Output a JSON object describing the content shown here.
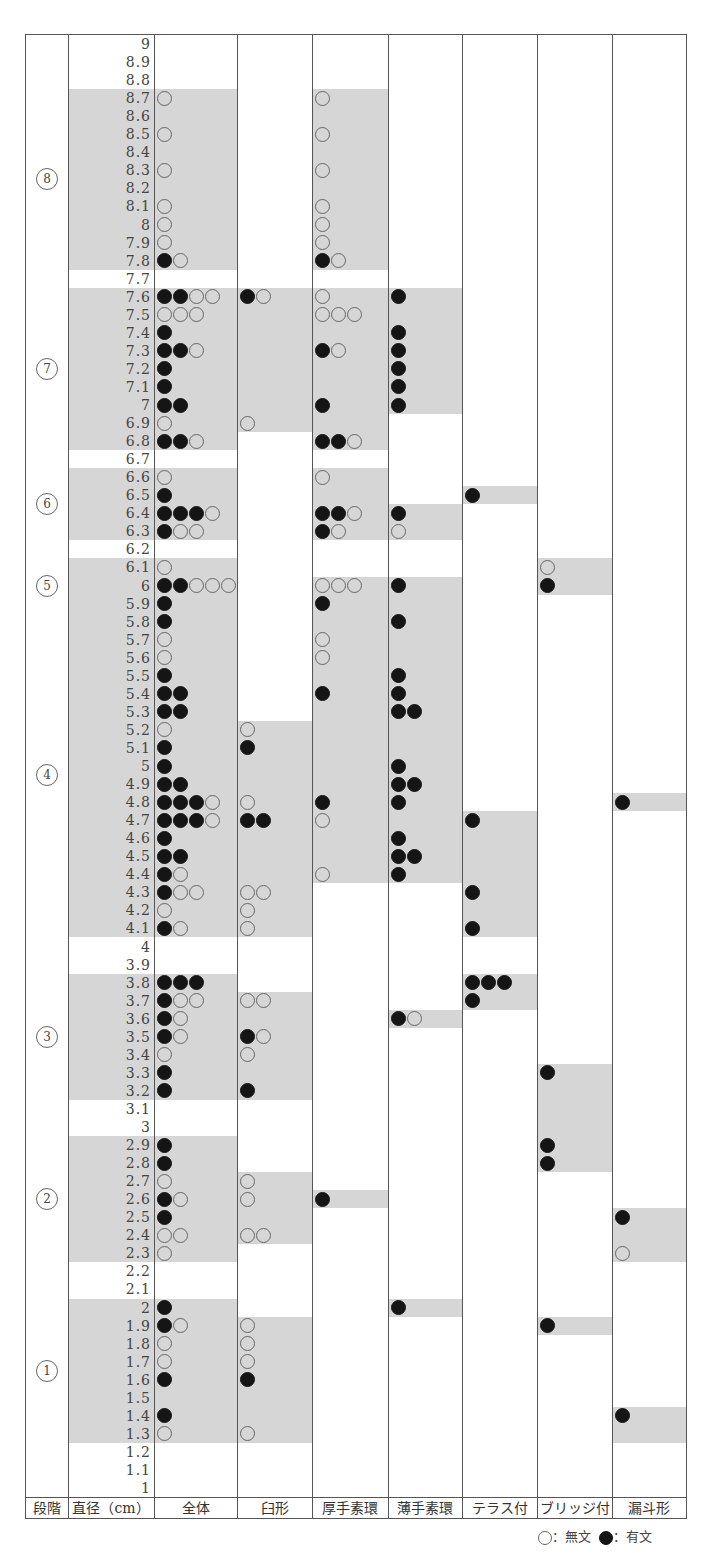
{
  "chart_data": {
    "type": "table",
    "title": "",
    "row_axis": {
      "label": "直径（cm）",
      "values_top_to_bottom": [
        9,
        8.9,
        8.8,
        8.7,
        8.6,
        8.5,
        8.4,
        8.3,
        8.2,
        8.1,
        8,
        7.9,
        7.8,
        7.7,
        7.6,
        7.5,
        7.4,
        7.3,
        7.2,
        7.1,
        7,
        6.9,
        6.8,
        6.7,
        6.6,
        6.5,
        6.4,
        6.3,
        6.2,
        6.1,
        6,
        5.9,
        5.8,
        5.7,
        5.6,
        5.5,
        5.4,
        5.3,
        5.2,
        5.1,
        5,
        4.9,
        4.8,
        4.7,
        4.6,
        4.5,
        4.4,
        4.3,
        4.2,
        4.1,
        4,
        3.9,
        3.8,
        3.7,
        3.6,
        3.5,
        3.4,
        3.3,
        3.2,
        3.1,
        3,
        2.9,
        2.8,
        2.7,
        2.6,
        2.5,
        2.4,
        2.3,
        2.2,
        2.1,
        2,
        1.9,
        1.8,
        1.7,
        1.6,
        1.5,
        1.4,
        1.3,
        1.2,
        1.1,
        1
      ]
    },
    "stage_label": "段階",
    "stages": [
      {
        "label": "⑧",
        "from": 8.7,
        "to": 7.8
      },
      {
        "label": "⑦",
        "from": 7.6,
        "to": 6.8
      },
      {
        "label": "⑥",
        "from": 6.6,
        "to": 6.3
      },
      {
        "label": "⑤",
        "from": 6.1,
        "to": 5.9
      },
      {
        "label": "④",
        "from": 5.8,
        "to": 4.1
      },
      {
        "label": "③",
        "from": 3.8,
        "to": 3.2
      },
      {
        "label": "②",
        "from": 2.9,
        "to": 2.3
      },
      {
        "label": "①",
        "from": 2.0,
        "to": 1.3
      }
    ],
    "columns": [
      "全体",
      "臼形",
      "厚手素環",
      "薄手素環",
      "テラス付",
      "ブリッジ付",
      "漏斗形"
    ],
    "legend": [
      {
        "symbol": "open",
        "label": "○：無文"
      },
      {
        "symbol": "filled",
        "label": "●：有文"
      }
    ],
    "note": "Each cell lists markers: F = 有文 (filled), O = 無文 (open). Shaded ranges mark the span of each type.",
    "shaded_ranges": {
      "直径": [
        [
          8.7,
          7.8
        ],
        [
          7.6,
          6.8
        ],
        [
          6.6,
          6.3
        ],
        [
          6.1,
          4.1
        ],
        [
          3.8,
          3.2
        ],
        [
          2.9,
          2.3
        ],
        [
          2.0,
          1.3
        ]
      ],
      "全体": [
        [
          8.7,
          7.8
        ],
        [
          7.6,
          6.8
        ],
        [
          6.6,
          6.3
        ],
        [
          6.1,
          4.1
        ],
        [
          3.8,
          3.2
        ],
        [
          2.9,
          2.3
        ],
        [
          2.0,
          1.3
        ]
      ],
      "臼形": [
        [
          7.6,
          6.9
        ],
        [
          5.2,
          4.1
        ],
        [
          3.7,
          3.2
        ],
        [
          2.7,
          2.4
        ],
        [
          1.9,
          1.3
        ]
      ],
      "厚手素環": [
        [
          8.7,
          7.8
        ],
        [
          7.6,
          6.8
        ],
        [
          6.6,
          6.3
        ],
        [
          6.0,
          4.4
        ],
        [
          2.6,
          2.6
        ]
      ],
      "薄手素環": [
        [
          7.6,
          7.0
        ],
        [
          6.4,
          6.3
        ],
        [
          6.0,
          4.4
        ],
        [
          3.6,
          3.6
        ],
        [
          2.0,
          2.0
        ]
      ],
      "テラス付": [
        [
          6.5,
          6.5
        ],
        [
          4.7,
          4.1
        ],
        [
          3.8,
          3.7
        ]
      ],
      "ブリッジ付": [
        [
          6.1,
          6.0
        ],
        [
          3.3,
          2.8
        ],
        [
          1.9,
          1.9
        ]
      ],
      "漏斗形": [
        [
          4.8,
          4.8
        ],
        [
          2.5,
          2.3
        ],
        [
          1.4,
          1.3
        ]
      ]
    },
    "cells": {
      "全体": {
        "8.7": "O",
        "8.5": "O",
        "8.3": "O",
        "8.1": "O",
        "8": "O",
        "7.9": "O",
        "7.8": "FO",
        "7.6": "FFOO",
        "7.5": "OOO",
        "7.4": "F",
        "7.3": "FFO",
        "7.2": "F",
        "7.1": "F",
        "7": "FF",
        "6.9": "O",
        "6.8": "FFO",
        "6.6": "O",
        "6.5": "F",
        "6.4": "FFFO",
        "6.3": "FOO",
        "6.1": "O",
        "6": "FFOOO",
        "5.9": "F",
        "5.8": "F",
        "5.7": "O",
        "5.6": "O",
        "5.5": "F",
        "5.4": "FF",
        "5.3": "FF",
        "5.2": "O",
        "5.1": "F",
        "5": "F",
        "4.9": "FF",
        "4.8": "FFFO",
        "4.7": "FFFO",
        "4.6": "F",
        "4.5": "FF",
        "4.4": "FO",
        "4.3": "FOO",
        "4.2": "O",
        "4.1": "FO",
        "3.8": "FFF",
        "3.7": "FOO",
        "3.6": "FO",
        "3.5": "FO",
        "3.4": "O",
        "3.3": "F",
        "3.2": "F",
        "2.9": "F",
        "2.8": "F",
        "2.7": "O",
        "2.6": "FO",
        "2.5": "F",
        "2.4": "OO",
        "2.3": "O",
        "2": "F",
        "1.9": "FO",
        "1.8": "O",
        "1.7": "O",
        "1.6": "F",
        "1.4": "F",
        "1.3": "O"
      },
      "臼形": {
        "7.6": "FO",
        "6.9": "O",
        "5.2": "O",
        "5.1": "F",
        "4.8": "O",
        "4.7": "FF",
        "4.3": "OO",
        "4.2": "O",
        "4.1": "O",
        "3.7": "OO",
        "3.5": "FO",
        "3.4": "O",
        "3.2": "F",
        "2.7": "O",
        "2.6": "O",
        "2.4": "OO",
        "1.9": "O",
        "1.8": "O",
        "1.7": "O",
        "1.6": "F",
        "1.3": "O"
      },
      "厚手素環": {
        "8.7": "O",
        "8.5": "O",
        "8.3": "O",
        "8.1": "O",
        "8": "O",
        "7.9": "O",
        "7.8": "FO",
        "7.6": "O",
        "7.5": "OOO",
        "7.3": "FO",
        "7": "F",
        "6.8": "FFO",
        "6.6": "O",
        "6.4": "FFO",
        "6.3": "FO",
        "6": "OOO",
        "5.9": "F",
        "5.7": "O",
        "5.6": "O",
        "5.4": "F",
        "4.8": "F",
        "4.7": "O",
        "4.4": "O",
        "2.6": "F"
      },
      "薄手素環": {
        "7.6": "F",
        "7.4": "F",
        "7.3": "F",
        "7.2": "F",
        "7.1": "F",
        "7": "F",
        "6.4": "F",
        "6.3": "O",
        "6": "F",
        "5.8": "F",
        "5.5": "F",
        "5.4": "F",
        "5.3": "FF",
        "5": "F",
        "4.9": "FF",
        "4.8": "F",
        "4.6": "F",
        "4.5": "FF",
        "4.4": "F",
        "3.6": "FO",
        "2": "F"
      },
      "テラス付": {
        "6.5": "F",
        "4.7": "F",
        "4.3": "F",
        "4.1": "F",
        "3.8": "FFF",
        "3.7": "F"
      },
      "ブリッジ付": {
        "6.1": "O",
        "6": "F",
        "3.3": "F",
        "2.9": "F",
        "2.8": "F",
        "1.9": "F"
      },
      "漏斗形": {
        "4.8": "F",
        "2.5": "F",
        "2.3": "O",
        "1.4": "F"
      }
    }
  },
  "header": {
    "stage": "段階",
    "diameter": "直径（cm）",
    "col_all": "全体",
    "col_usu": "臼形",
    "col_atsude": "厚手素環",
    "col_usude": "薄手素環",
    "col_terrace": "テラス付",
    "col_bridge": "ブリッジ付",
    "col_funnel": "漏斗形"
  },
  "legend": {
    "open_label": "：無文",
    "filled_label": "：有文"
  },
  "colors": {
    "shade": "#d6d6d6",
    "filled": "#151515",
    "line": "#555555"
  }
}
